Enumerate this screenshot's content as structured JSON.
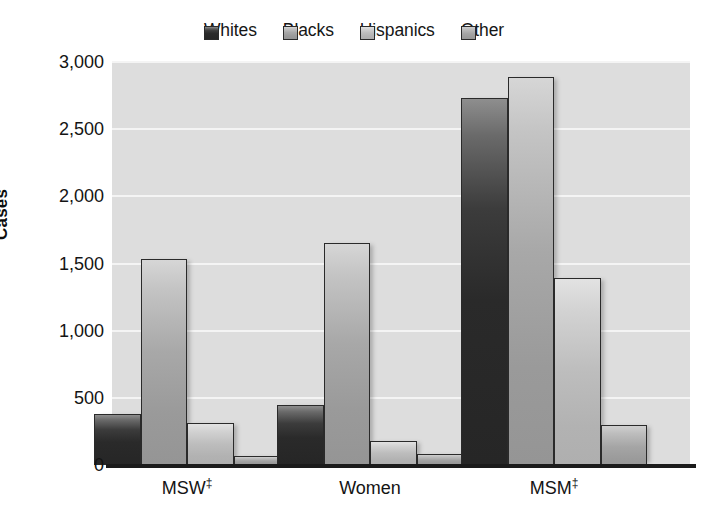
{
  "chart_data": {
    "type": "bar",
    "title": "",
    "xlabel": "",
    "ylabel": "Cases",
    "categories": [
      "MSW‡",
      "Women",
      "MSM‡"
    ],
    "series": [
      {
        "name": "Whites",
        "values": [
          380,
          445,
          2730
        ],
        "color": "#2f2f2f"
      },
      {
        "name": "Blacks",
        "values": [
          1535,
          1650,
          2890
        ],
        "color": "#a5a5a5"
      },
      {
        "name": "Hispanics",
        "values": [
          315,
          180,
          1390
        ],
        "color": "#c0c0c0"
      },
      {
        "name": "Other",
        "values": [
          70,
          80,
          300
        ],
        "color": "#a9a9a9"
      }
    ],
    "ylim": [
      0,
      3000
    ],
    "yticks": [
      0,
      500,
      1000,
      1500,
      2000,
      2500,
      3000
    ],
    "ytick_labels": [
      "0",
      "500",
      "1,000",
      "1,500",
      "2,000",
      "2,500",
      "3,000"
    ],
    "grid": true,
    "legend_position": "top-center",
    "plot_background": "#dddddd",
    "gridline_color": "#f4f4f4"
  },
  "legend": {
    "items": [
      {
        "label": "Whites",
        "swatch_class": "s-whites"
      },
      {
        "label": "Blacks",
        "swatch_class": "s-blacks"
      },
      {
        "label": "Hispanics",
        "swatch_class": "s-hispanics"
      },
      {
        "label": "Other",
        "swatch_class": "s-other"
      }
    ]
  },
  "axes": {
    "y_label": "Cases",
    "y_ticks": [
      "3,000",
      "2,500",
      "2,000",
      "1,500",
      "1,000",
      "500",
      "0"
    ],
    "x_ticks": [
      {
        "base": "MSW",
        "marker": "‡"
      },
      {
        "base": "Women",
        "marker": ""
      },
      {
        "base": "MSM",
        "marker": "‡"
      }
    ]
  }
}
